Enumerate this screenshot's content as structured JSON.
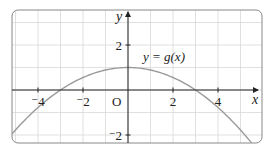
{
  "chart_data": {
    "type": "line",
    "title": "",
    "function_label": "y = g(x)",
    "xlabel": "x",
    "ylabel": "y",
    "origin_label": "O",
    "xlim": [
      -5.2,
      5.9
    ],
    "ylim": [
      -2.6,
      3.5
    ],
    "x_ticks": [
      {
        "v": -4,
        "label": "⁻4"
      },
      {
        "v": -2,
        "label": "⁻2"
      },
      {
        "v": 2,
        "label": "2"
      },
      {
        "v": 4,
        "label": "4"
      }
    ],
    "y_ticks": [
      {
        "v": 2,
        "label": "2"
      },
      {
        "v": -2,
        "label": "⁻2"
      }
    ],
    "grid": true,
    "grid_step": 1,
    "curve": {
      "description": "downward parabola, vertex (0,1), roots at x=-3 and x=3",
      "x": [
        -5,
        -4,
        -3,
        -2,
        -1,
        0,
        1,
        2,
        3,
        4,
        5
      ],
      "y": [
        -1.78,
        -0.78,
        0,
        0.56,
        0.89,
        1,
        0.89,
        0.56,
        0,
        -0.78,
        -1.78
      ]
    },
    "colors": {
      "curve": "#9a9a9a",
      "grid": "#d8d8d8",
      "axes": "#222222",
      "frame": "#888888"
    }
  }
}
